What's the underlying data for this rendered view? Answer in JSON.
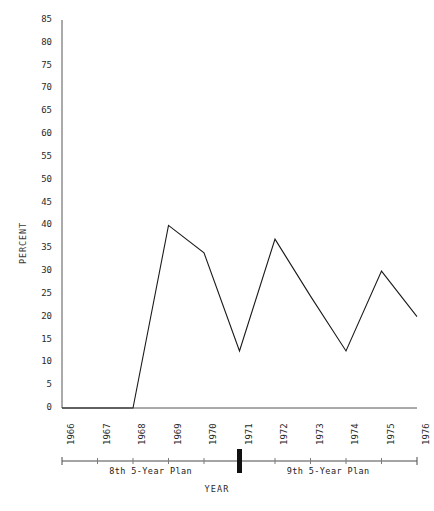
{
  "chart_data": {
    "type": "line",
    "title": "",
    "xlabel": "YEAR",
    "ylabel": "PERCENT",
    "x": [
      1966,
      1967,
      1968,
      1969,
      1970,
      1971,
      1972,
      1973,
      1974,
      1975,
      1976
    ],
    "categories": [
      "1966",
      "1967",
      "1968",
      "1969",
      "1970",
      "1971",
      "1972",
      "1973",
      "1974",
      "1975",
      "1976"
    ],
    "values": [
      0,
      0,
      0,
      40,
      34,
      12.5,
      37,
      24.5,
      12.5,
      30,
      20
    ],
    "series": [
      {
        "name": "percent",
        "values": [
          0,
          0,
          0,
          40,
          34,
          12.5,
          37,
          24.5,
          12.5,
          30,
          20
        ]
      }
    ],
    "ylim": [
      0,
      85
    ],
    "xlim": [
      1966,
      1976
    ],
    "ytick_values": [
      0,
      5,
      10,
      15,
      20,
      25,
      30,
      35,
      40,
      45,
      50,
      55,
      60,
      65,
      70,
      75,
      80,
      85
    ],
    "ytick_labels": [
      "0",
      "5",
      "10",
      "15",
      "20",
      "25",
      "30",
      "35",
      "40",
      "45",
      "50",
      "55",
      "60",
      "65",
      "70",
      "75",
      "80",
      "85"
    ],
    "xtick_labels": [
      "1966",
      "1967",
      "1968",
      "1969",
      "1970",
      "1971",
      "1972",
      "1973",
      "1974",
      "1975",
      "1976"
    ],
    "grid": false,
    "legend": "none",
    "line_color": "#1a1a1a",
    "annotations": [
      {
        "text": "8th 5-Year Plan",
        "span": [
          1966,
          1971
        ]
      },
      {
        "text": "9th 5-Year Plan",
        "span": [
          1971,
          1976
        ]
      }
    ]
  },
  "axes": {
    "y_title": "PERCENT",
    "x_title": "YEAR"
  },
  "plan_bar": {
    "left_label": "8th 5-Year Plan",
    "right_label": "9th 5-Year Plan",
    "divider_year": "1971"
  }
}
